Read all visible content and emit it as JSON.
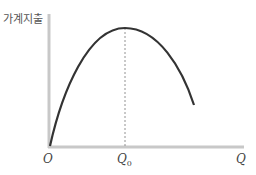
{
  "diagram": {
    "y_axis_label": "가계지출",
    "x_axis_label": "Q",
    "origin_label": "O",
    "q0_label": "Q",
    "q0_subscript": "0",
    "curve": "inverted-U household expenditure curve peaking at Q0",
    "colors": {
      "axis": "#c8c8c8",
      "curve": "#333333",
      "dashed": "#777777"
    }
  }
}
